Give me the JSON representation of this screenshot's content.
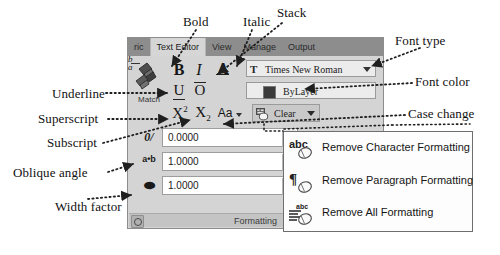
{
  "ribbon": {
    "tabs": [
      {
        "label": "ric",
        "active": false
      },
      {
        "label": "Text Editor",
        "active": true
      },
      {
        "label": "View",
        "active": false
      },
      {
        "label": "Manage",
        "active": false
      },
      {
        "label": "Output",
        "active": false
      }
    ],
    "panel_title": "Formatting",
    "match_label": "Match",
    "buttons": {
      "bold": "B",
      "italic": "I",
      "stack": "A",
      "underline": "U",
      "overline": "O",
      "fraction_top": "b",
      "fraction_bottom": "a",
      "superscript_base": "X",
      "superscript_mark": "2",
      "subscript_base": "X",
      "subscript_mark": "2",
      "case_change": "Aa"
    },
    "font_combo": {
      "icon_glyph": "T",
      "value": "Times New Roman"
    },
    "color_combo": {
      "value": "ByLayer",
      "swatch": "#3a3a3a"
    },
    "clear_button": {
      "label": "Clear"
    },
    "spinners": [
      {
        "icon": "0/",
        "value": "0.0000",
        "name": "oblique-angle"
      },
      {
        "icon": "a•b",
        "value": "1.0000",
        "name": "tracking"
      },
      {
        "icon": "⬬",
        "value": "1.0000",
        "name": "width-factor"
      }
    ]
  },
  "menu": {
    "items": [
      {
        "icon": "abc",
        "label": "Remove Character Formatting"
      },
      {
        "icon": "¶",
        "label": "Remove Paragraph Formatting"
      },
      {
        "icon": "lines-abc",
        "label": "Remove All Formatting"
      }
    ]
  },
  "annotations": [
    {
      "id": "bold",
      "label": "Bold"
    },
    {
      "id": "italic",
      "label": "Italic"
    },
    {
      "id": "stack",
      "label": "Stack"
    },
    {
      "id": "font-type",
      "label": "Font type"
    },
    {
      "id": "font-color",
      "label": "Font color"
    },
    {
      "id": "case-change",
      "label": "Case change"
    },
    {
      "id": "underline",
      "label": "Underline"
    },
    {
      "id": "superscript",
      "label": "Superscript"
    },
    {
      "id": "subscript",
      "label": "Subscript"
    },
    {
      "id": "oblique-angle",
      "label": "Oblique angle"
    },
    {
      "id": "width-factor",
      "label": "Width factor"
    }
  ]
}
